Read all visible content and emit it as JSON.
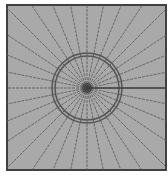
{
  "diagram": {
    "type": "radial-mesh",
    "colors": {
      "background": "#ffffff",
      "fill": "#a9a9a9",
      "border": "#404040",
      "mesh_line": "#5e5e5e",
      "circle": "#555555",
      "center": "#3a3a3a"
    },
    "frame": {
      "x": 7,
      "y": 5,
      "width": 159,
      "height": 165
    },
    "center": {
      "x": 87,
      "y": 88
    },
    "circles": [
      {
        "r": 35
      },
      {
        "r": 32
      }
    ],
    "radial_line_count": 32,
    "crack_line": {
      "from": "center",
      "to": "right-edge"
    }
  }
}
